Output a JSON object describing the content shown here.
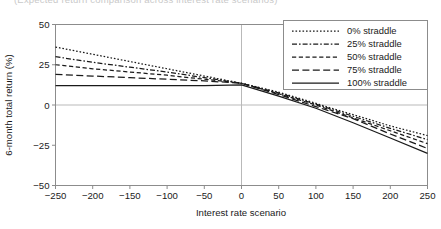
{
  "caption_fragment": "(Expected return comparison across interest rate scenarios)",
  "chart_data": {
    "type": "line",
    "title": "",
    "xlabel": "Interest rate scenario",
    "ylabel": "6-month total return (%)",
    "xlim": [
      -250,
      250
    ],
    "ylim": [
      -50,
      50
    ],
    "xticks": [
      -250,
      -200,
      -150,
      -100,
      -50,
      0,
      50,
      100,
      150,
      200,
      250
    ],
    "xtick_labels": [
      "−250",
      "−200",
      "−150",
      "−100",
      "−50",
      "0",
      "50",
      "100",
      "150",
      "200",
      "250"
    ],
    "yticks": [
      50,
      25,
      0,
      -25,
      -50
    ],
    "ytick_labels": [
      "50",
      "25",
      "0",
      "−25",
      "−50"
    ],
    "grid": true,
    "gridlines": {
      "horizontal": [
        0
      ],
      "vertical": [
        0
      ]
    },
    "legend_position": "top-right",
    "x": [
      -250,
      -200,
      -150,
      -100,
      -50,
      0,
      50,
      100,
      150,
      200,
      250
    ],
    "series": [
      {
        "name": "0% straddle",
        "dash": "dotted",
        "values": [
          36,
          31.5,
          27,
          22.5,
          18,
          13.5,
          8,
          1,
          -6,
          -13,
          -19
        ]
      },
      {
        "name": "25% straddle",
        "dash": "dash-dot",
        "values": [
          30,
          26.5,
          23.5,
          20.5,
          17,
          13.5,
          7.5,
          0.5,
          -7,
          -14.5,
          -21.5
        ]
      },
      {
        "name": "50% straddle",
        "dash": "dashed",
        "values": [
          25,
          22.5,
          20.5,
          18.5,
          16,
          13.5,
          7,
          0,
          -8,
          -16,
          -24
        ]
      },
      {
        "name": "75% straddle",
        "dash": "long-dash",
        "values": [
          19,
          18,
          17,
          16,
          15,
          13.5,
          6.5,
          -1,
          -8.5,
          -18,
          -27
        ]
      },
      {
        "name": "100% straddle",
        "dash": "solid",
        "values": [
          12,
          12,
          12,
          12,
          12,
          12.5,
          5.5,
          -2,
          -11,
          -20.5,
          -30
        ]
      }
    ],
    "legend_entries": [
      "0% straddle",
      "25% straddle",
      "50% straddle",
      "75% straddle",
      "100% straddle"
    ],
    "colors": {
      "line": "#1a1a1a",
      "grid": "#b9b9b9",
      "frame": "#8c8c8c"
    }
  }
}
